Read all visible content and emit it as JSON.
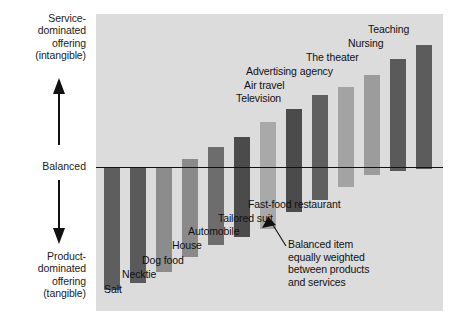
{
  "axis": {
    "top_label": "Service-\ndominated\noffering\n(intangible)",
    "top_label_lines": [
      "Service-",
      "dominated",
      "offering",
      "(intangible)"
    ],
    "middle_label": "Balanced",
    "bottom_label_lines": [
      "Product-",
      "dominated",
      "offering",
      "(tangible)"
    ],
    "up_arrow_icon": "arrow-up-icon",
    "down_arrow_icon": "arrow-down-icon"
  },
  "annotation": {
    "lines": [
      "Balanced item",
      "equally weighted",
      "between products",
      "and services"
    ],
    "pointer_icon": "arrow-pointer-icon"
  },
  "colors": {
    "panel": "#dcdcdc",
    "bar_dark": "#5b5b5b",
    "bar_darker": "#4a4a4a",
    "bar_mid": "#6f6f6f",
    "bar_light": "#a7a7a7",
    "bar_lighter": "#b9b9b9",
    "baseline": "#111111",
    "text": "#101010"
  },
  "chart_data": {
    "type": "bar",
    "title": "",
    "subtitle": "",
    "xlabel": "",
    "ylabel": "Balanced",
    "ylim": [
      -100,
      100
    ],
    "grid": false,
    "legend_position": "none",
    "axis_top_label": "Service-dominated offering (intangible)",
    "axis_bottom_label": "Product-dominated offering (tangible)",
    "axis_center_label": "Balanced",
    "categories": [
      "Salt",
      "Necktie",
      "Dog food",
      "House",
      "Automobile",
      "Tailored suit",
      "Fast-food restaurant",
      "Television",
      "Air travel",
      "Advertising agency",
      "The theater",
      "Nursing",
      "Teaching"
    ],
    "series": [
      {
        "name": "Intangible (service) share above balanced line",
        "values": [
          0,
          0,
          0,
          8,
          20,
          30,
          45,
          58,
          72,
          80,
          92,
          108,
          122
        ]
      },
      {
        "name": "Tangible (product) share below balanced line",
        "values": [
          -123,
          -116,
          -105,
          -90,
          -78,
          -70,
          -62,
          -45,
          -33,
          -20,
          -8,
          -4,
          -2
        ]
      }
    ],
    "annotations": [
      {
        "text": "Balanced item equally weighted between products and services",
        "target": "Fast-food restaurant"
      }
    ]
  },
  "bars": [
    {
      "label": "Salt",
      "x": 8,
      "w": 16,
      "up": 0,
      "down": 123,
      "color": "#5e5e5e",
      "label_x": 8,
      "label_y": 283
    },
    {
      "label": "Necktie",
      "x": 34,
      "w": 16,
      "up": 0,
      "down": 116,
      "color": "#5a5a5a",
      "label_x": 26,
      "label_y": 268
    },
    {
      "label": "Dog food",
      "x": 60,
      "w": 16,
      "up": 0,
      "down": 105,
      "color": "#8c8c8c",
      "label_x": 46,
      "label_y": 254
    },
    {
      "label": "House",
      "x": 86,
      "w": 16,
      "up": 8,
      "down": 90,
      "color": "#8a8a8a",
      "label_x": 76,
      "label_y": 239
    },
    {
      "label": "Automobile",
      "x": 112,
      "w": 16,
      "up": 20,
      "down": 78,
      "color": "#6d6d6d",
      "label_x": 92,
      "label_y": 225
    },
    {
      "label": "Tailored suit",
      "x": 138,
      "w": 16,
      "up": 30,
      "down": 70,
      "color": "#4b4b4b",
      "label_x": 122,
      "label_y": 212
    },
    {
      "label": "Fast-food restaurant",
      "x": 164,
      "w": 16,
      "up": 45,
      "down": 62,
      "color": "#a9a9a9",
      "label_x": 152,
      "label_y": 198
    },
    {
      "label": "Television",
      "x": 190,
      "w": 16,
      "up": 58,
      "down": 45,
      "color": "#4b4b4b",
      "label_x": 140,
      "label_y": 92
    },
    {
      "label": "Air travel",
      "x": 216,
      "w": 16,
      "up": 72,
      "down": 33,
      "color": "#5f5f5f",
      "label_x": 148,
      "label_y": 79
    },
    {
      "label": "Advertising agency",
      "x": 242,
      "w": 16,
      "up": 80,
      "down": 20,
      "color": "#a3a3a3",
      "label_x": 150,
      "label_y": 65
    },
    {
      "label": "The theater",
      "x": 268,
      "w": 16,
      "up": 92,
      "down": 8,
      "color": "#9c9c9c",
      "label_x": 210,
      "label_y": 51
    },
    {
      "label": "Nursing",
      "x": 294,
      "w": 16,
      "up": 108,
      "down": 4,
      "color": "#5a5a5a",
      "label_x": 252,
      "label_y": 37
    },
    {
      "label": "Teaching",
      "x": 320,
      "w": 16,
      "up": 122,
      "down": 2,
      "color": "#5c5c5c",
      "label_x": 272,
      "label_y": 23
    }
  ]
}
